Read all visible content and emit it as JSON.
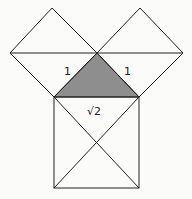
{
  "diagram": {
    "labels": {
      "left_leg": "1",
      "right_leg": "1",
      "hypotenuse": "√2"
    },
    "colors": {
      "background": "#fbfbf9",
      "line": "#222222",
      "shaded_triangle": "#8e8e8e"
    }
  }
}
